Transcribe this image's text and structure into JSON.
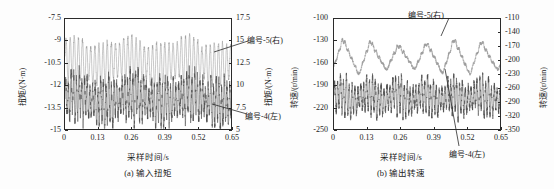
{
  "figure": {
    "background": "#fdfdfd",
    "axis_color": "#2a2a2a"
  },
  "series_style": {
    "series_5_color": "#9a9a9a",
    "series_4_color": "#4a4a4a"
  },
  "panel_a": {
    "caption": "(a) 输入扭矩",
    "xlabel": "采样时间/s",
    "ylabel_left": "扭矩/(N·m)",
    "ylabel_right": "扭矩/(N·m)",
    "xticks": [
      "0",
      "0.13",
      "0.26",
      "0.39",
      "0.52",
      "0.65"
    ],
    "yticks_left": [
      "-7.5",
      "-9",
      "-10.5",
      "-12",
      "-13.5",
      "-15"
    ],
    "yticks_right": [
      "17.5",
      "15",
      "12.5",
      "10",
      "7.5",
      "5"
    ],
    "annotation_upper": "编号-5(右)",
    "annotation_lower": "编号-4(左)"
  },
  "panel_b": {
    "caption": "(b) 输出转速",
    "xlabel": "采样时间/s",
    "ylabel_left": "转速/(r/min)",
    "ylabel_right": "转速/(r/min)",
    "xticks": [
      "0",
      "0.13",
      "0.26",
      "0.39",
      "0.52",
      "0.65"
    ],
    "yticks_left": [
      "-100",
      "-130",
      "-160",
      "-190",
      "-220",
      "-250"
    ],
    "yticks_right": [
      "-110",
      "-140",
      "-170",
      "-200",
      "-230",
      "-260",
      "-290",
      "-320",
      "-350"
    ],
    "annotation_upper": "编号-5(右)",
    "annotation_lower": "编号-4(左)"
  },
  "chart_data": [
    {
      "type": "line",
      "panel": "a",
      "title": "(a) 输入扭矩",
      "xlabel": "采样时间/s",
      "ylabel": "扭矩/(N·m)",
      "ylabel_secondary": "扭矩/(N·m)",
      "xlim": [
        0,
        0.65
      ],
      "ylim": [
        -15,
        -7.5
      ],
      "ylim_secondary": [
        5,
        17.5
      ],
      "xticks": [
        0,
        0.13,
        0.26,
        0.39,
        0.52,
        0.65
      ],
      "yticks": [
        -7.5,
        -9,
        -10.5,
        -12,
        -13.5,
        -15
      ],
      "yticks_secondary": [
        17.5,
        15,
        12.5,
        10,
        7.5,
        5
      ],
      "grid": false,
      "legend": "annotations",
      "series": [
        {
          "name": "编号-5(右)",
          "axis": "secondary",
          "color": "#9a9a9a",
          "carrier_hz": 62,
          "envelope_hz": 9.2,
          "mean": 12.6,
          "amplitude_min": 0.9,
          "amplitude_max": 2.6,
          "noise": 0.22,
          "description": "高频振荡带幅值调制，均值约12.6 N·m，峰值可达15.5，谷值约10"
        },
        {
          "name": "编号-4(左)",
          "axis": "primary",
          "color": "#4a4a4a",
          "carrier_hz": 95,
          "envelope_hz": 9.2,
          "mean": -13.0,
          "amplitude_min": 0.5,
          "amplitude_max": 1.5,
          "noise": 0.35,
          "description": "高频宽带振荡，均值约-13.0 N·m，包络峰约-11.7，谷约-14.6"
        }
      ]
    },
    {
      "type": "line",
      "panel": "b",
      "title": "(b) 输出转速",
      "xlabel": "采样时间/s",
      "ylabel": "转速/(r/min)",
      "ylabel_secondary": "转速/(r/min)",
      "xlim": [
        0,
        0.65
      ],
      "ylim": [
        -250,
        -100
      ],
      "ylim_secondary": [
        -350,
        -110
      ],
      "xticks": [
        0,
        0.13,
        0.26,
        0.39,
        0.52,
        0.65
      ],
      "yticks": [
        -100,
        -130,
        -160,
        -190,
        -220,
        -250
      ],
      "yticks_secondary": [
        -110,
        -140,
        -170,
        -200,
        -230,
        -260,
        -290,
        -320,
        -350
      ],
      "grid": false,
      "legend": "annotations",
      "series": [
        {
          "name": "编号-5(右)",
          "axis": "secondary",
          "color": "#9a9a9a",
          "carrier_hz": 9.2,
          "envelope_hz": 9.2,
          "mean": -193,
          "amplitude_min": 26,
          "amplitude_max": 40,
          "noise": 3.5,
          "description": "约6个明显周期的锯齿/三角波，峰约-135，谷约-245（右轴刻度）"
        },
        {
          "name": "编号-4(左)",
          "axis": "primary",
          "color": "#4a4a4a",
          "carrier_hz": 88,
          "envelope_hz": 9.2,
          "mean": -207,
          "amplitude_min": 8,
          "amplitude_max": 24,
          "noise": 5.0,
          "description": "高频宽带噪声叠加周期性包络，均值约-207 r/min"
        }
      ]
    }
  ]
}
